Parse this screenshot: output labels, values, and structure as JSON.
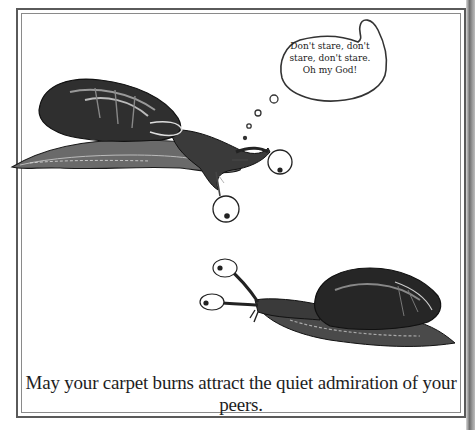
{
  "card": {
    "caption": "May your carpet burns attract the quiet admiration of your peers.",
    "speech_bubble": {
      "lines": [
        "Don't stare, don't",
        "stare, don't stare.",
        "Oh my God!"
      ]
    },
    "illustrations": [
      {
        "name": "upper-snail",
        "description": "Snail with shell facing right, eyestalks with cartoon googly eyes, thought bubble trail"
      },
      {
        "name": "lower-snail",
        "description": "Snail facing left with two cartoon eyes on stalks"
      }
    ]
  }
}
